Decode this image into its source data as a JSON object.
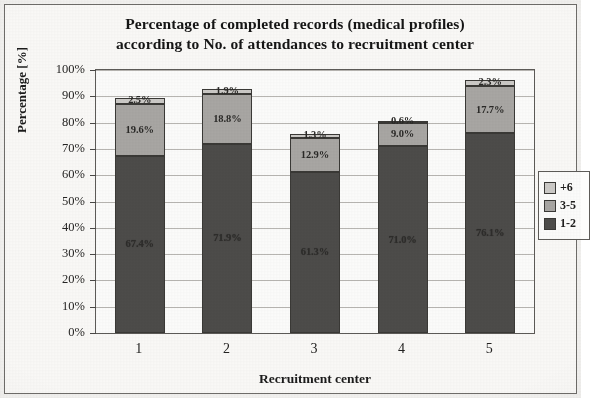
{
  "chart_data": {
    "type": "bar",
    "stacked": true,
    "title": "Percentage of completed records (medical profiles) according to No. of attendances to recruitment center",
    "title_line1": "Percentage of completed records (medical profiles)",
    "title_line2": "according to No. of attendances to recruitment center",
    "xlabel": "Recruitment center",
    "ylabel": "Percentage [%]",
    "categories": [
      "1",
      "2",
      "3",
      "4",
      "5"
    ],
    "ylim": [
      0,
      100
    ],
    "ytick_labels": [
      "0%",
      "10%",
      "20%",
      "30%",
      "40%",
      "50%",
      "60%",
      "70%",
      "80%",
      "90%",
      "100%"
    ],
    "ytick_values": [
      0,
      10,
      20,
      30,
      40,
      50,
      60,
      70,
      80,
      90,
      100
    ],
    "grid": true,
    "legend_position": "right",
    "series": [
      {
        "name": "1-2",
        "color": "#4d4c4a",
        "values": [
          67.4,
          71.9,
          61.3,
          71.0,
          76.1
        ],
        "labels": [
          "67.4%",
          "71.9%",
          "61.3%",
          "71.0%",
          "76.1%"
        ]
      },
      {
        "name": "3-5",
        "color": "#a9a7a4",
        "values": [
          19.6,
          18.8,
          12.9,
          9.0,
          17.7
        ],
        "labels": [
          "19.6%",
          "18.8%",
          "12.9%",
          "9.0%",
          "17.7%"
        ]
      },
      {
        "name": "+6",
        "color": "#cdcbc8",
        "values": [
          2.5,
          1.9,
          1.3,
          0.6,
          2.3
        ],
        "labels": [
          "2.5%",
          "1.9%",
          "1.3%",
          "0.6%",
          "2.3%"
        ]
      }
    ],
    "totals": [
      89.5,
      92.6,
      75.5,
      80.6,
      96.1
    ]
  },
  "legend": {
    "items": [
      {
        "label": "+6",
        "color": "#cdcbc8"
      },
      {
        "label": "3-5",
        "color": "#a9a7a4"
      },
      {
        "label": "1-2",
        "color": "#4d4c4a"
      }
    ]
  }
}
